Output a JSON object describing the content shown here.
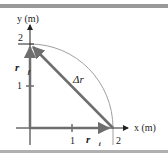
{
  "figure": {
    "y_axis_label": "y (m)",
    "x_axis_label": "x (m)",
    "y_ticks": [
      {
        "value": "1"
      },
      {
        "value": "2"
      }
    ],
    "x_ticks": [
      {
        "value": "1"
      },
      {
        "value": "2"
      }
    ],
    "vectors": {
      "r_final": {
        "label": "r⃗",
        "subscript": "f"
      },
      "r_initial": {
        "label": "r⃗",
        "subscript": "i"
      },
      "delta_r": {
        "label": "Δr⃗"
      }
    },
    "colors": {
      "axis": "#222222",
      "vector": "#6e6e6e",
      "arc": "#a0a0a0",
      "frame_bar": "#9a9a9a"
    }
  }
}
